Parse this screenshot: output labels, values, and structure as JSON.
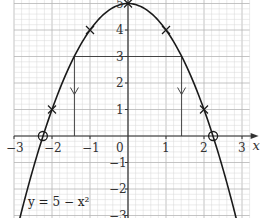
{
  "chart_data": {
    "type": "line",
    "title": "",
    "equation_label": "y = 5 − x²",
    "xlabel": "x",
    "ylabel": "y",
    "xlim": [
      -3,
      3.2
    ],
    "ylim": [
      -4,
      6.8
    ],
    "grid": true,
    "x_ticks": [
      -3,
      -2,
      -1,
      1,
      2,
      3
    ],
    "x_tick_labels": [
      "−3",
      "−2",
      "−1",
      "1",
      "2",
      "3"
    ],
    "origin_label": "0",
    "y_ticks": [
      -4,
      -3,
      -2,
      -1,
      1,
      2,
      3,
      4,
      5,
      6
    ],
    "y_tick_labels": [
      "−4",
      "−3",
      "−2",
      "−1",
      "1",
      "2",
      "3",
      "4",
      "5",
      "6"
    ],
    "series": [
      {
        "name": "y = 5 − x²",
        "function": "5 - x^2",
        "x": [
          -3,
          -2.5,
          -2,
          -1.5,
          -1,
          -0.5,
          0,
          0.5,
          1,
          1.5,
          2,
          2.5,
          3
        ],
        "values": [
          -4,
          -1.25,
          1,
          2.75,
          4,
          4.75,
          5,
          4.75,
          4,
          2.75,
          1,
          -1.25,
          -4
        ]
      }
    ],
    "plotted_points_x_markers": [
      {
        "x": -3,
        "y": -4
      },
      {
        "x": -2,
        "y": 1
      },
      {
        "x": -1,
        "y": 4
      },
      {
        "x": 0,
        "y": 5
      },
      {
        "x": 1,
        "y": 4
      },
      {
        "x": 2,
        "y": 1
      },
      {
        "x": 3,
        "y": -4
      }
    ],
    "roots_circled": [
      {
        "x": -2.24,
        "y": 0
      },
      {
        "x": 2.24,
        "y": 0
      }
    ],
    "annotations": [
      {
        "type": "horizontal_line",
        "y": 3,
        "x_from": -1.41,
        "x_to": 1.41
      },
      {
        "type": "arrow_down",
        "x": -1.41,
        "y_from": 3,
        "y_to": 0
      },
      {
        "type": "arrow_down",
        "x": 1.41,
        "y_from": 3,
        "y_to": 0
      }
    ]
  },
  "layout": {
    "origin_px": [
      128,
      136
    ],
    "x_unit_px": 38,
    "y_unit_px": 26.5,
    "colors": {
      "grid_minor": "#d9d9d9",
      "grid_major": "#b5b5b5",
      "axis": "#333333",
      "curve": "#1a1a1a",
      "annotation": "#444444"
    }
  }
}
